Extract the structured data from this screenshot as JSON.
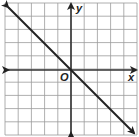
{
  "chart_data": {
    "type": "line",
    "title": "",
    "xlabel": "x",
    "ylabel": "y",
    "origin_label": "O",
    "xlim": [
      -5,
      5
    ],
    "ylim": [
      -5,
      5
    ],
    "grid": true,
    "grid_step": 1,
    "ticks_labeled": false,
    "series": [
      {
        "name": "line",
        "equation": "y = -x",
        "x": [
          -5,
          0,
          5
        ],
        "y": [
          5,
          0,
          -5
        ],
        "arrows_both_ends": true
      }
    ],
    "colors": {
      "grid": "#9a9a9a",
      "axes": "#333333",
      "line": "#222222"
    }
  }
}
